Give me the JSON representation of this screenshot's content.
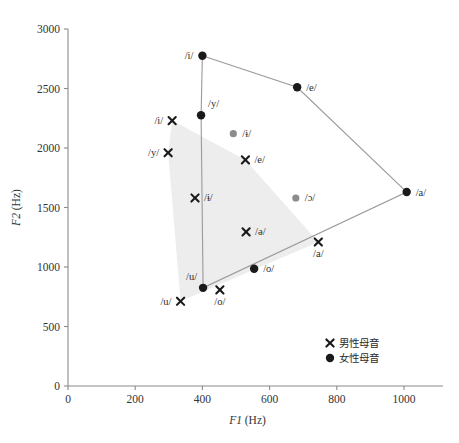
{
  "chart_data": {
    "type": "scatter",
    "title": "",
    "xlabel": "F1 (Hz)",
    "ylabel": "F2 (Hz)",
    "xlabel_italic": "F1",
    "xlabel_unit": "(Hz)",
    "ylabel_italic": "F2",
    "ylabel_unit": "(Hz)",
    "xlim": [
      0,
      1100
    ],
    "ylim": [
      0,
      3000
    ],
    "xticks": [
      0,
      200,
      400,
      600,
      800,
      1000
    ],
    "yticks": [
      0,
      500,
      1000,
      1500,
      2000,
      2500,
      3000
    ],
    "grid": false,
    "legend_position": "bottom-right",
    "legend": [
      {
        "marker": "cross",
        "label": "男性母音"
      },
      {
        "marker": "dot",
        "label": "女性母音"
      }
    ],
    "series": [
      {
        "name": "男性母音",
        "marker": "cross",
        "color": "#1a1a1a",
        "points": [
          {
            "label": "/i/",
            "x": 310,
            "y": 2230,
            "label_pos": "left"
          },
          {
            "label": "/y/",
            "x": 298,
            "y": 1960,
            "label_pos": "left"
          },
          {
            "label": "/ɨ/",
            "x": 378,
            "y": 1580,
            "label_pos": "right"
          },
          {
            "label": "/e/",
            "x": 528,
            "y": 1900,
            "label_pos": "right"
          },
          {
            "label": "/ə/",
            "x": 530,
            "y": 1295,
            "label_pos": "right"
          },
          {
            "label": "/a/",
            "x": 745,
            "y": 1210,
            "label_pos": "below"
          },
          {
            "label": "/o/",
            "x": 452,
            "y": 808,
            "label_pos": "below"
          },
          {
            "label": "/u/",
            "x": 335,
            "y": 712,
            "label_pos": "left"
          }
        ]
      },
      {
        "name": "女性母音",
        "marker": "dot",
        "color": "#1a1a1a",
        "points": [
          {
            "label": "/i/",
            "x": 400,
            "y": 2775,
            "label_pos": "left"
          },
          {
            "label": "/y/",
            "x": 396,
            "y": 2275,
            "label_pos": "upright"
          },
          {
            "label": "/ɨ/",
            "x": 492,
            "y": 2120,
            "label_pos": "right",
            "muted": true
          },
          {
            "label": "/e/",
            "x": 682,
            "y": 2510,
            "label_pos": "right"
          },
          {
            "label": "/ɔ/",
            "x": 678,
            "y": 1580,
            "label_pos": "right",
            "muted": true
          },
          {
            "label": "/a/",
            "x": 1008,
            "y": 1630,
            "label_pos": "right"
          },
          {
            "label": "/o/",
            "x": 554,
            "y": 985,
            "label_pos": "right"
          },
          {
            "label": "/u/",
            "x": 402,
            "y": 825,
            "label_pos": "upleft"
          }
        ]
      }
    ],
    "female_hull": [
      "/i/",
      "/e/",
      "/a/",
      "/u/",
      "/y/"
    ],
    "male_hull_vertices": [
      {
        "x": 310,
        "y": 2230
      },
      {
        "x": 528,
        "y": 1900
      },
      {
        "x": 745,
        "y": 1210
      },
      {
        "x": 335,
        "y": 712
      },
      {
        "x": 298,
        "y": 1960
      }
    ]
  }
}
